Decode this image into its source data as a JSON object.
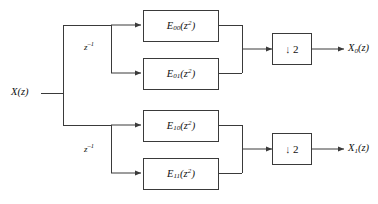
{
  "diagram": {
    "line_color": "#3a3a3a",
    "text_color": "#111111",
    "background": "#ffffff",
    "input": {
      "name": "input-signal",
      "label_main": "X",
      "label_paren_open": "(",
      "label_var": "z",
      "label_paren_close": ")"
    },
    "delays": [
      {
        "name": "delay-top",
        "base": "z",
        "exponent": "–1"
      },
      {
        "name": "delay-bottom",
        "base": "z",
        "exponent": "–1"
      }
    ],
    "blocks": [
      {
        "name": "polyphase-e00",
        "base": "E",
        "sub": "00",
        "arg_open": "(",
        "arg_var": "z",
        "arg_exp": "2",
        "arg_close": ")"
      },
      {
        "name": "polyphase-e01",
        "base": "E",
        "sub": "01",
        "arg_open": "(",
        "arg_var": "z",
        "arg_exp": "2",
        "arg_close": ")"
      },
      {
        "name": "polyphase-e10",
        "base": "E",
        "sub": "10",
        "arg_open": "(",
        "arg_var": "z",
        "arg_exp": "2",
        "arg_close": ")"
      },
      {
        "name": "polyphase-e11",
        "base": "E",
        "sub": "11",
        "arg_open": "(",
        "arg_var": "z",
        "arg_exp": "2",
        "arg_close": ")"
      }
    ],
    "downsamplers": [
      {
        "name": "downsampler-top",
        "arrow": "↓",
        "factor": "2"
      },
      {
        "name": "downsampler-bottom",
        "arrow": "↓",
        "factor": "2"
      }
    ],
    "outputs": [
      {
        "name": "output-x0",
        "base": "X",
        "sub": "0",
        "open": "(",
        "var": "z",
        "close": ")"
      },
      {
        "name": "output-x1",
        "base": "X",
        "sub": "1",
        "open": "(",
        "var": "z",
        "close": ")"
      }
    ]
  }
}
